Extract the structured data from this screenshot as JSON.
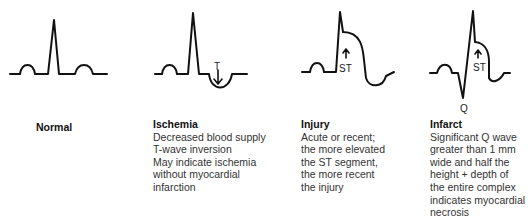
{
  "panels": [
    {
      "id": "normal",
      "title": "Normal",
      "lines": []
    },
    {
      "id": "ischemia",
      "title": "Ischemia",
      "wave_label": "T",
      "lines": [
        "Decreased blood supply",
        "T-wave inversion",
        "May indicate ischemia",
        "without myocardial",
        "infarction"
      ]
    },
    {
      "id": "injury",
      "title": "Injury",
      "wave_label": "ST",
      "lines": [
        "Acute or recent;",
        "the more elevated",
        "the ST segment,",
        "the more recent",
        "the injury"
      ]
    },
    {
      "id": "infarct",
      "title": "Infarct",
      "wave_label": "ST",
      "wave_label_2": "Q",
      "lines": [
        "Significant Q wave",
        "greater than 1 mm",
        "wide and half the",
        "height + depth of",
        "the entire complex",
        "indicates myocardial",
        "necrosis"
      ]
    }
  ]
}
